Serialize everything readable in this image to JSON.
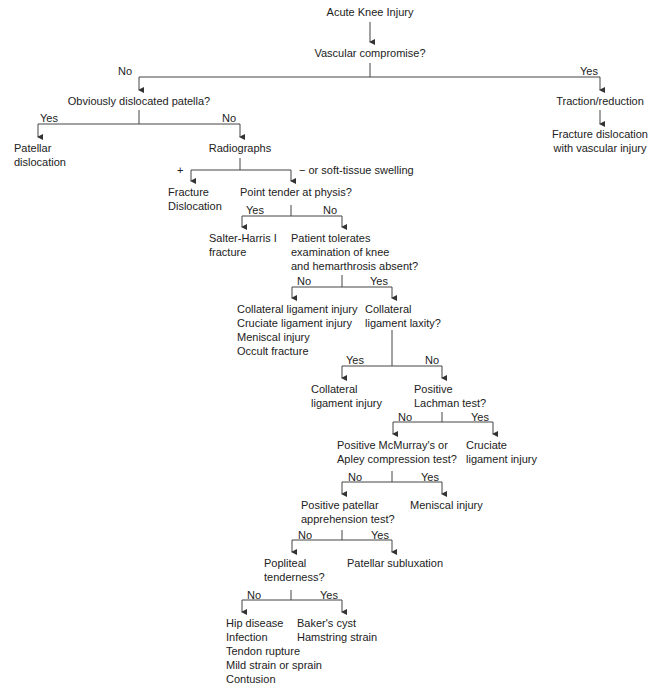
{
  "title": "Acute Knee Injury",
  "nodes": {
    "vascular": "Vascular compromise?",
    "obvious_patella": "Obviously dislocated patella?",
    "traction": "Traction/reduction",
    "fracture_vascular": "Fracture dislocation\nwith vascular injury",
    "patellar_dislocation": "Patellar\ndislocation",
    "radiographs": "Radiographs",
    "radiograph_plus": "+",
    "radiograph_minus": "− or soft-tissue swelling",
    "fracture_dislocation": "Fracture\nDislocation",
    "point_tender": "Point tender at physis?",
    "salter_harris": "Salter-Harris I\nfracture",
    "patient_tolerates": "Patient tolerates\nexamination of knee\nand hemarthrosis absent?",
    "multi_injury": "Collateral ligament injury\nCruciate ligament injury\nMeniscal injury\nOccult fracture",
    "collateral_laxity": "Collateral\nligament laxity?",
    "collateral_injury": "Collateral\nligament injury",
    "lachman": "Positive\nLachman test?",
    "mcmurray": "Positive McMurray's or\nApley compression test?",
    "cruciate_injury": "Cruciate\nligament injury",
    "patellar_apprehension": "Positive patellar\napprehension test?",
    "meniscal_injury": "Meniscal injury",
    "popliteal": "Popliteal\ntenderness?",
    "patellar_subluxation": "Patellar subluxation",
    "no_popliteal": "Hip disease\nInfection\nTendon rupture\nMild strain or sprain\nContusion",
    "yes_popliteal": "Baker's cyst\nHamstring strain"
  },
  "branch_labels": {
    "yes": "Yes",
    "no": "No"
  }
}
